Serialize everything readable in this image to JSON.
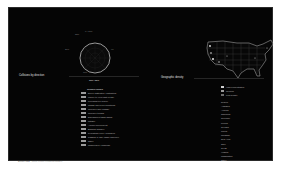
{
  "radial_chart": {
    "labels": {
      "top": "0 / 360",
      "top_left": "330",
      "left": "270",
      "right": "90",
      "bottom": "180"
    },
    "caption": "180 / 360"
  },
  "left_section": {
    "title": "Collisions by direction"
  },
  "map_section": {
    "title": "Geographic density"
  },
  "center_list": {
    "header": "Collision causes",
    "items": [
      {
        "code": "0004",
        "label": "Driver inattention / distraction"
      },
      {
        "code": "0008",
        "label": "Failure to yield right of way"
      },
      {
        "code": "0012",
        "label": "Following too closely"
      },
      {
        "code": "0016",
        "label": "Unsafe speed for conditions"
      },
      {
        "code": "0020",
        "label": "Improper lane change"
      },
      {
        "code": "0024",
        "label": "Improper turning"
      },
      {
        "code": "0028",
        "label": "Disregarded traffic signal"
      },
      {
        "code": "0032",
        "label": "Fatigue"
      },
      {
        "code": "0036",
        "label": "Alcohol involvement"
      },
      {
        "code": "0040",
        "label": "Backing unsafely"
      },
      {
        "code": "0044",
        "label": "Pedestrian error / confusion"
      },
      {
        "code": "0048",
        "label": "Passing or lane usage improper"
      },
      {
        "code": "0052",
        "label": "Other"
      },
      {
        "code": "0056",
        "label": "Unspecified / unknown"
      }
    ]
  },
  "right_list": {
    "legend": [
      {
        "label": "High concentration"
      },
      {
        "label": "Medium"
      },
      {
        "label": "Low density"
      }
    ],
    "regions_header": "Region",
    "regions": [
      "Alabama",
      "Arizona",
      "California",
      "Colorado",
      "Florida",
      "Georgia",
      "Illinois",
      "Michigan",
      "New York",
      "Ohio",
      "Texas",
      "Virginia",
      "Washington",
      "Other"
    ]
  },
  "footer": {
    "left": "Source data · ",
    "right": "Motor vehicle collisions dataset"
  }
}
